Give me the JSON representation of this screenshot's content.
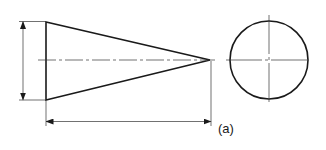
{
  "figure": {
    "label": "(a)",
    "colors": {
      "line": "#1a1a1a",
      "thin_line": "#333333",
      "background": "#ffffff"
    }
  },
  "views": {
    "elevation": {
      "shape": "cone-triangle",
      "base": {
        "x": 46,
        "top": 22,
        "bottom": 100
      },
      "apex": {
        "x": 210,
        "y": 60
      },
      "centerline_y": 60
    },
    "end_view": {
      "shape": "circle",
      "center": {
        "x": 269,
        "y": 60
      },
      "radius": 39
    }
  },
  "dimensions": {
    "diameter": {
      "x": 23,
      "from_y": 21,
      "to_y": 100,
      "text": ""
    },
    "length": {
      "y": 121,
      "from_x": 46,
      "to_x": 211,
      "text": ""
    }
  }
}
